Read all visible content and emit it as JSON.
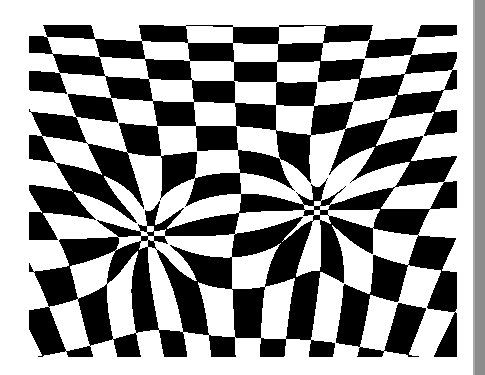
{
  "artwork": {
    "subject": "warped checkerboard optical illusion with two funnel vortices",
    "colors": {
      "dark": "#000000",
      "light": "#ffffff",
      "background": "#ffffff",
      "edge_strip": "#8c8c8c"
    },
    "bounds": {
      "x": 29,
      "y": 25,
      "width": 428,
      "height": 332
    },
    "vortices": [
      {
        "name": "left",
        "cx": 119,
        "cy": 210,
        "strength": 1.0
      },
      {
        "name": "right",
        "cx": 288,
        "cy": 185,
        "strength": 1.0
      }
    ],
    "cell_size": 26
  }
}
